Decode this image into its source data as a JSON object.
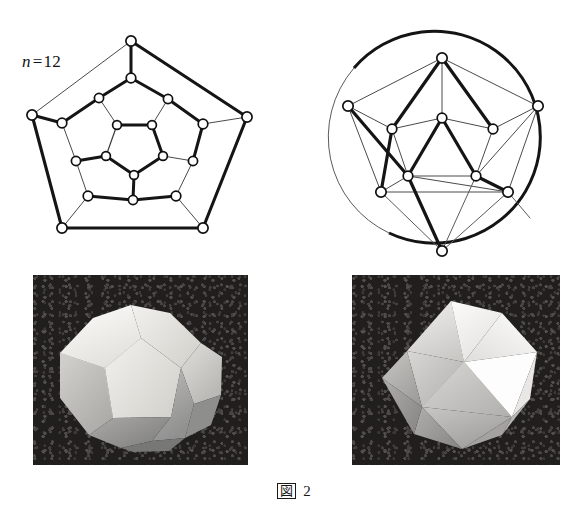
{
  "figure": {
    "caption_symbol": "図",
    "caption_number": "2",
    "caption_full": "図 2"
  },
  "panels": {
    "dodecahedron_graph": {
      "name": "dodecahedron-schlegel-diagram",
      "label_variable": "n",
      "label_equals": "=",
      "label_value": "12",
      "label_text": "n=12",
      "vertex_count": 20,
      "edge_count": 30,
      "face_count": 12,
      "outline_shape": "pentagon"
    },
    "icosahedron_graph": {
      "name": "icosahedron-schlegel-diagram",
      "label_variable": "n",
      "label_equals": "=",
      "label_value": "20",
      "label_text": "n=20",
      "vertex_count": 12,
      "edge_count": 30,
      "face_count": 20,
      "outline_shape": "circle"
    },
    "dodecahedron_photo": {
      "name": "dodecahedron-photograph",
      "alt": "Photograph of a dodecahedron model on a dark textured background"
    },
    "icosahedron_photo": {
      "name": "icosahedron-photograph",
      "alt": "Photograph of an icosahedron model on a dark textured background"
    }
  },
  "colors": {
    "ink": "#1a1a1a",
    "paper": "#ffffff",
    "node_fill": "#ffffff",
    "edge_thick": "#111111",
    "edge_thin": "#3a3a3a",
    "photo_background": "#211f1e"
  },
  "graph_geometry": {
    "dodecahedron": {
      "outer": [
        {
          "id": "o1",
          "x": 131,
          "y": 41
        },
        {
          "id": "o2",
          "x": 247,
          "y": 117
        },
        {
          "id": "o3",
          "x": 203,
          "y": 228
        },
        {
          "id": "o4",
          "x": 62,
          "y": 228
        },
        {
          "id": "o5",
          "x": 32,
          "y": 115
        }
      ],
      "ring2": [
        {
          "id": "m1",
          "x": 131,
          "y": 78
        },
        {
          "id": "m2",
          "x": 203,
          "y": 124
        },
        {
          "id": "m3",
          "x": 176,
          "y": 196
        },
        {
          "id": "m4",
          "x": 88,
          "y": 196
        },
        {
          "id": "m5",
          "x": 62,
          "y": 123
        }
      ],
      "ring3": [
        {
          "id": "p1",
          "x": 99,
          "y": 98
        },
        {
          "id": "p2",
          "x": 168,
          "y": 99
        },
        {
          "id": "p3",
          "x": 193,
          "y": 161
        },
        {
          "id": "p4",
          "x": 133,
          "y": 200
        },
        {
          "id": "p5",
          "x": 76,
          "y": 161
        }
      ],
      "inner": [
        {
          "id": "i1",
          "x": 117,
          "y": 125
        },
        {
          "id": "i2",
          "x": 152,
          "y": 125
        },
        {
          "id": "i3",
          "x": 163,
          "y": 156
        },
        {
          "id": "i4",
          "x": 134,
          "y": 175
        },
        {
          "id": "i5",
          "x": 106,
          "y": 156
        }
      ]
    },
    "icosahedron": {
      "circle": {
        "cx": 148,
        "cy": 133,
        "r": 106
      },
      "outer": [
        {
          "id": "c1",
          "x": 148,
          "y": 58
        },
        {
          "id": "c2",
          "x": 244,
          "y": 106
        },
        {
          "id": "c3",
          "x": 214,
          "y": 192
        },
        {
          "id": "c4",
          "x": 87,
          "y": 192
        },
        {
          "id": "c5",
          "x": 54,
          "y": 106
        }
      ],
      "mid": [
        {
          "id": "d1",
          "x": 148,
          "y": 118
        },
        {
          "id": "d2",
          "x": 199,
          "y": 129
        },
        {
          "id": "d3",
          "x": 182,
          "y": 176
        },
        {
          "id": "d4",
          "x": 114,
          "y": 176
        },
        {
          "id": "d5",
          "x": 98,
          "y": 129
        }
      ],
      "apex": {
        "id": "a1",
        "x": 148,
        "y": 251
      }
    }
  }
}
